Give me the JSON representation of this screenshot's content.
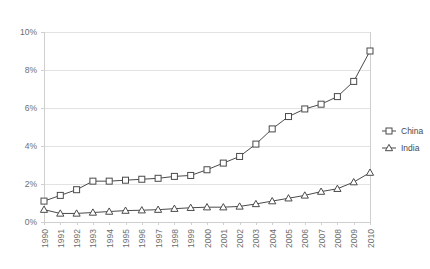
{
  "chart_data": {
    "type": "line",
    "title": "",
    "xlabel": "",
    "ylabel": "",
    "grid": true,
    "legend_position": "right",
    "ylim": [
      0,
      10
    ],
    "yticks": [
      "0%",
      "2%",
      "4%",
      "6%",
      "8%",
      "10%"
    ],
    "ytick_values": [
      0,
      2,
      4,
      6,
      8,
      10
    ],
    "x": [
      "1990",
      "1991",
      "1992",
      "1993",
      "1994",
      "1995",
      "1996",
      "1997",
      "1998",
      "1999",
      "2000",
      "2001",
      "2002",
      "2003",
      "2004",
      "2005",
      "2006",
      "2007",
      "2008",
      "2009",
      "2010"
    ],
    "series": [
      {
        "name": "China",
        "marker": "square",
        "color": "#4a4a4a",
        "values": [
          1.1,
          1.4,
          1.7,
          2.15,
          2.15,
          2.2,
          2.25,
          2.3,
          2.4,
          2.45,
          2.75,
          3.1,
          3.45,
          4.1,
          4.9,
          5.55,
          5.95,
          6.2,
          6.6,
          7.4,
          9.0
        ]
      },
      {
        "name": "India",
        "marker": "triangle",
        "color": "#4a4a4a",
        "values": [
          0.65,
          0.45,
          0.45,
          0.5,
          0.55,
          0.6,
          0.62,
          0.65,
          0.7,
          0.75,
          0.78,
          0.78,
          0.82,
          0.95,
          1.1,
          1.25,
          1.4,
          1.6,
          1.75,
          2.1,
          2.6
        ]
      }
    ]
  },
  "legend": {
    "items": [
      {
        "label": "China"
      },
      {
        "label": "India"
      }
    ]
  }
}
